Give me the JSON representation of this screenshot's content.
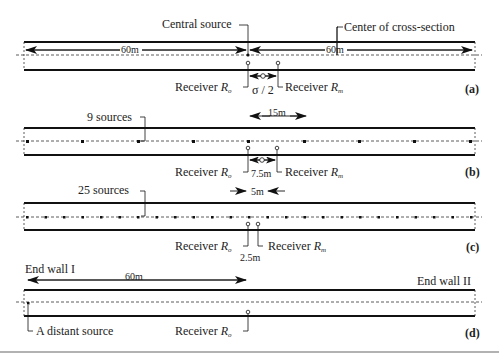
{
  "panels": {
    "a": {
      "tag": "(a)",
      "central_source": "Central source",
      "center_cross_section": "Center of cross-section",
      "dist_left": "60m",
      "dist_right": "60m",
      "receiver_0": "Receiver",
      "receiver_0_symbol": "R",
      "receiver_0_sub": "o",
      "spacing": "σ / 2",
      "receiver_m": "Receiver",
      "receiver_m_symbol": "R",
      "receiver_m_sub": "m"
    },
    "b": {
      "tag": "(b)",
      "sources_label": "9 sources",
      "source_spacing": "15m",
      "receiver_spacing": "7.5m",
      "receiver_0": "Receiver",
      "receiver_0_symbol": "R",
      "receiver_0_sub": "o",
      "receiver_m": "Receiver",
      "receiver_m_symbol": "R",
      "receiver_m_sub": "m"
    },
    "c": {
      "tag": "(c)",
      "sources_label": "25 sources",
      "source_spacing": "5m",
      "receiver_spacing": "2.5m",
      "receiver_0": "Receiver",
      "receiver_0_symbol": "R",
      "receiver_0_sub": "o",
      "receiver_m": "Receiver",
      "receiver_m_symbol": "R",
      "receiver_m_sub": "m"
    },
    "d": {
      "tag": "(d)",
      "end_wall_1": "End wall I",
      "end_wall_2": "End wall II",
      "distance": "60m",
      "distant_source": "A distant source",
      "receiver_0": "Receiver",
      "receiver_0_symbol": "R",
      "receiver_0_sub": "o"
    }
  }
}
